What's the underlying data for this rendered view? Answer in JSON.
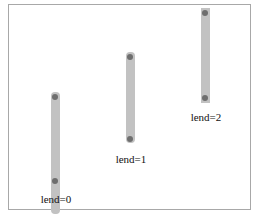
{
  "lines": [
    {
      "label": "lend=0",
      "x": 55,
      "top": 92,
      "bottom": 214,
      "dot_top": 97,
      "dot_bottom": 209,
      "label_y": 194
    },
    {
      "label": "lend=1",
      "x": 130,
      "top": 52,
      "bottom": 145,
      "dot_top": 57,
      "dot_bottom": 139,
      "label_y": 153
    },
    {
      "label": "lend=2",
      "x": 205,
      "top": 8,
      "bottom": 103,
      "dot_top": 13,
      "dot_bottom": 98,
      "label_y": 112
    }
  ],
  "colors": {
    "bar": "#c2c2c2",
    "dot": "#6e6e6e",
    "border": "#a8a8a8"
  }
}
